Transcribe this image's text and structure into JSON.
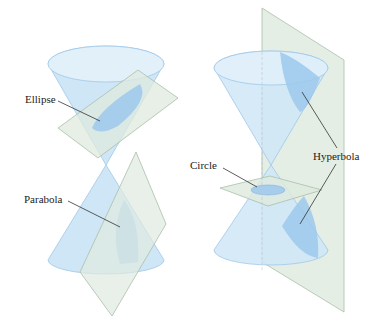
{
  "figure": {
    "colors": {
      "cone_fill": "#cfe6f7",
      "cone_stroke": "#9ec8e8",
      "section_fill": "#9cc8ec",
      "plane_fill": "#dfeadf",
      "plane_stroke": "#a9bfa9",
      "leader": "#333333"
    },
    "left": {
      "labels": {
        "ellipse": "Ellipse",
        "parabola": "Parabola"
      }
    },
    "right": {
      "labels": {
        "circle": "Circle",
        "hyperbola": "Hyperbola"
      }
    }
  }
}
